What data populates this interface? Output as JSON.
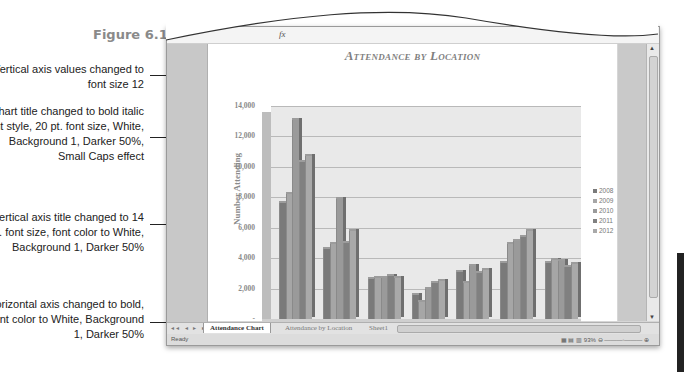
{
  "figure": {
    "label": "Figure 6.12"
  },
  "callouts": [
    {
      "text": "Vertical axis values changed to font size 12"
    },
    {
      "text": "Chart title changed to bold italic font style, 20 pt. font size, White, Background 1, Darker 50%, Small Caps effect"
    },
    {
      "text": "Vertical axis title changed to 14 pt. font size, font color to White, Background 1, Darker 50%"
    },
    {
      "text": "Horizontal axis changed to bold, font color to White, Background 1, Darker 50%"
    }
  ],
  "excel": {
    "formula_bar": {
      "fx_label": "fx"
    },
    "sheet_tabs": [
      {
        "label": "Attendance Chart",
        "active": true
      },
      {
        "label": "Attendance by Location",
        "active": false
      },
      {
        "label": "Sheet1",
        "active": false
      },
      {
        "label": "Sheet2",
        "active": false
      }
    ],
    "tab_nav": "◂◂ ◂ ▸ ▸▸",
    "status": {
      "ready": "Ready",
      "zoom_level": "93%"
    }
  },
  "colors": {
    "s2008": "#7a7a7a",
    "s2009": "#a6a6a6",
    "s2010": "#9a9a9a",
    "s2011": "#808080",
    "s2012": "#a9a9a9"
  },
  "chart_data": {
    "type": "bar",
    "title": "Attendance by Location",
    "xlabel": "",
    "ylabel": "Number Attending",
    "ylim": [
      0,
      14000
    ],
    "yticks": [
      "-",
      "2,000",
      "4,000",
      "6,000",
      "8,000",
      "10,000",
      "12,000",
      "14,000"
    ],
    "grid": true,
    "legend_position": "right",
    "categories": [
      "Manhattan",
      "White Plains",
      "Albany",
      "Montclair",
      "Hightstown",
      "Newark",
      "Garden City"
    ],
    "series": [
      {
        "name": "2008",
        "values": [
          7600,
          4600,
          2600,
          1600,
          3100,
          3700,
          3700
        ]
      },
      {
        "name": "2009",
        "values": [
          8200,
          4900,
          2700,
          1100,
          2400,
          4900,
          3900
        ]
      },
      {
        "name": "2010",
        "values": [
          13100,
          7900,
          2700,
          2000,
          3500,
          5100,
          3800
        ]
      },
      {
        "name": "2011",
        "values": [
          10300,
          5000,
          2800,
          2400,
          3000,
          5400,
          3400
        ]
      },
      {
        "name": "2012",
        "values": [
          10700,
          5800,
          2700,
          2500,
          3200,
          5800,
          3600
        ]
      }
    ]
  }
}
